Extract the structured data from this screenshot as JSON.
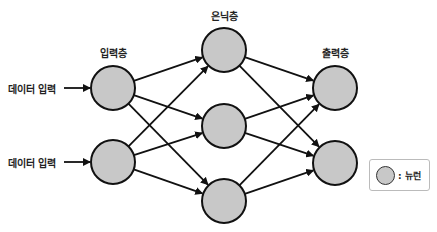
{
  "diagram": {
    "layers": [
      {
        "id": "input",
        "title": "입력층",
        "nodes": [
          [
            113,
            88
          ],
          [
            113,
            162
          ]
        ]
      },
      {
        "id": "hidden",
        "title": "은닉층",
        "nodes": [
          [
            224,
            50
          ],
          [
            224,
            126
          ],
          [
            224,
            201
          ]
        ]
      },
      {
        "id": "output",
        "title": "출력층",
        "nodes": [
          [
            335,
            88
          ],
          [
            335,
            163
          ]
        ]
      }
    ],
    "inputs": [
      {
        "label": "데이터 입력",
        "y": 88
      },
      {
        "label": "데이터 입력",
        "y": 162
      }
    ],
    "connections": "fully-connected: input→hidden, hidden→output",
    "legend": {
      "symbol": "neuron-circle",
      "text": ": 뉴런"
    },
    "colors": {
      "node_fill": "#c8c8c8",
      "stroke": "#111111"
    }
  }
}
